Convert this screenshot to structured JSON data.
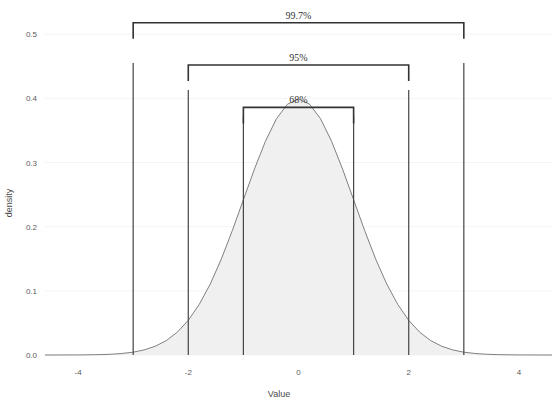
{
  "chart_data": {
    "type": "area",
    "title": "",
    "xlabel": "Value",
    "ylabel": "density",
    "xlim": [
      -4.6,
      4.6
    ],
    "ylim": [
      0.0,
      0.53
    ],
    "grid": true,
    "legend_position": "none",
    "distribution": "standard normal density (mean 0, sd 1)",
    "x_ticks": [
      "-4",
      "-2",
      "0",
      "2",
      "4"
    ],
    "x_tick_values": [
      -4,
      -2,
      0,
      2,
      4
    ],
    "y_ticks": [
      "0.0",
      "0.1",
      "0.2",
      "0.3",
      "0.4",
      "0.5"
    ],
    "y_tick_values": [
      0.0,
      0.1,
      0.2,
      0.3,
      0.4,
      0.5
    ],
    "peak_value": 0.3989,
    "peak_x": 0,
    "series": [
      {
        "name": "density",
        "x": [
          -4.6,
          -4.4,
          -4.2,
          -4.0,
          -3.8,
          -3.6,
          -3.4,
          -3.2,
          -3.0,
          -2.8,
          -2.6,
          -2.4,
          -2.2,
          -2.0,
          -1.8,
          -1.6,
          -1.4,
          -1.2,
          -1.0,
          -0.8,
          -0.6,
          -0.4,
          -0.2,
          0.0,
          0.2,
          0.4,
          0.6,
          0.8,
          1.0,
          1.2,
          1.4,
          1.6,
          1.8,
          2.0,
          2.2,
          2.4,
          2.6,
          2.8,
          3.0,
          3.2,
          3.4,
          3.6,
          3.8,
          4.0,
          4.2,
          4.4,
          4.6
        ],
        "values": [
          0.0,
          0.0,
          0.0001,
          0.0001,
          0.0003,
          0.0006,
          0.0012,
          0.0024,
          0.0044,
          0.0079,
          0.0136,
          0.0224,
          0.0355,
          0.054,
          0.079,
          0.1109,
          0.1497,
          0.1942,
          0.242,
          0.2897,
          0.3332,
          0.3683,
          0.391,
          0.3989,
          0.391,
          0.3683,
          0.3332,
          0.2897,
          0.242,
          0.1942,
          0.1497,
          0.1109,
          0.079,
          0.054,
          0.0355,
          0.0224,
          0.0136,
          0.0079,
          0.0044,
          0.0024,
          0.0012,
          0.0006,
          0.0003,
          0.0001,
          0.0001,
          0.0,
          0.0
        ]
      }
    ],
    "vertical_lines": [
      {
        "x": -3,
        "label": "-3 sd",
        "top_value": 0.455
      },
      {
        "x": -2,
        "label": "-2 sd",
        "top_value": 0.413
      },
      {
        "x": -1,
        "label": "-1 sd",
        "top_value": 0.372
      },
      {
        "x": 1,
        "label": "+1 sd",
        "top_value": 0.372
      },
      {
        "x": 2,
        "label": "+2 sd",
        "top_value": 0.413
      },
      {
        "x": 3,
        "label": "+3 sd",
        "top_value": 0.455
      }
    ],
    "annotations": [
      {
        "label": "68%",
        "from_x": -1,
        "to_x": 1,
        "bracket_value": 0.386
      },
      {
        "label": "95%",
        "from_x": -2,
        "to_x": 2,
        "bracket_value": 0.452
      },
      {
        "label": "99.7%",
        "from_x": -3,
        "to_x": 3,
        "bracket_value": 0.518
      }
    ]
  },
  "colors": {
    "curve": "#808080",
    "fill": "#f0f0f0",
    "rule": "#444444",
    "bracket": "#333333",
    "grid": "#f4f4f4",
    "text": "#4a4a4a",
    "background": "#ffffff"
  }
}
